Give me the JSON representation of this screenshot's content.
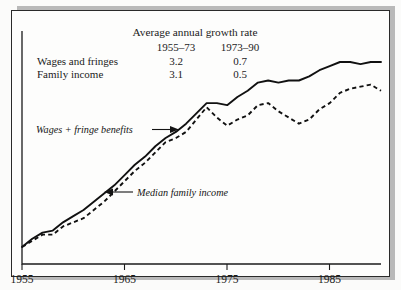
{
  "figure": {
    "title": "Average annual growth rate",
    "table": {
      "column_headers": [
        "1955–73",
        "1973–90"
      ],
      "rows": [
        {
          "label": "Wages and fringes",
          "values": [
            "3.2",
            "0.7"
          ]
        },
        {
          "label": "Family income",
          "values": [
            "3.1",
            "0.5"
          ]
        }
      ]
    },
    "annotations": [
      {
        "text": "Wages + fringe benefits"
      },
      {
        "text": "Median family income"
      }
    ]
  },
  "chart_data": {
    "type": "line",
    "title": "Average annual growth rate",
    "xlabel": "",
    "ylabel": "",
    "xlim": [
      1955,
      1990
    ],
    "xticks": [
      1955,
      1965,
      1975,
      1985
    ],
    "xtick_labels": [
      "1955",
      "1965",
      "1975",
      "1985"
    ],
    "grid": false,
    "legend": "annotated-inline",
    "note": "Indexed real levels; y-axis unlabeled. Values are index readings estimated from the plotted curves.",
    "x": [
      1955,
      1956,
      1957,
      1958,
      1959,
      1960,
      1961,
      1962,
      1963,
      1964,
      1965,
      1966,
      1967,
      1968,
      1969,
      1970,
      1971,
      1972,
      1973,
      1974,
      1975,
      1976,
      1977,
      1978,
      1979,
      1980,
      1981,
      1982,
      1983,
      1984,
      1985,
      1986,
      1987,
      1988,
      1989,
      1990
    ],
    "series": [
      {
        "name": "Wages + fringe benefits",
        "style": "solid",
        "growth_1955_73": 3.2,
        "growth_1973_90": 0.7,
        "values": [
          100,
          104,
          107,
          108,
          112,
          115,
          118,
          122,
          126,
          130,
          135,
          140,
          144,
          149,
          153,
          156,
          160,
          165,
          170,
          170,
          169,
          173,
          176,
          180,
          181,
          180,
          181,
          181,
          183,
          186,
          188,
          190,
          190,
          189,
          190,
          190
        ]
      },
      {
        "name": "Median family income",
        "style": "dashed",
        "growth_1955_73": 3.1,
        "growth_1973_90": 0.5,
        "values": [
          100,
          103,
          106,
          106,
          110,
          112,
          114,
          118,
          122,
          127,
          132,
          137,
          141,
          146,
          151,
          153,
          156,
          162,
          168,
          163,
          159,
          162,
          164,
          169,
          170,
          166,
          163,
          160,
          162,
          167,
          170,
          175,
          177,
          178,
          179,
          176
        ]
      }
    ]
  }
}
